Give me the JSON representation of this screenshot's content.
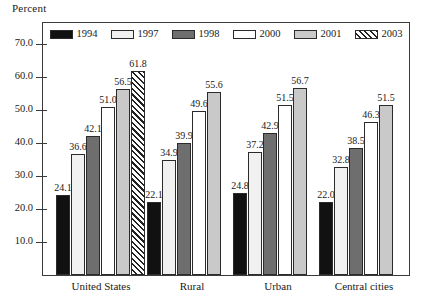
{
  "chart_data": {
    "type": "bar",
    "title": "",
    "xlabel": "",
    "ylabel": "Percent",
    "ylim": [
      0,
      75
    ],
    "yticks": [
      "10.0",
      "20.0",
      "30.0",
      "40.0",
      "50.0",
      "60.0",
      "70.0"
    ],
    "ytick_values": [
      10,
      20,
      30,
      40,
      50,
      60,
      70
    ],
    "grid": false,
    "legend_position": "top-inside",
    "categories": [
      "United States",
      "Rural",
      "Urban",
      "Central cities"
    ],
    "series": [
      {
        "name": "1994",
        "swatch": "fill-black",
        "color": "#111111",
        "values": [
          24.1,
          22.1,
          24.8,
          22.0
        ]
      },
      {
        "name": "1997",
        "swatch": "fill-offwht",
        "color": "#f1f1f1",
        "values": [
          36.6,
          34.9,
          37.2,
          32.8
        ]
      },
      {
        "name": "1998",
        "swatch": "fill-dgray",
        "color": "#6e6e6e",
        "values": [
          42.1,
          39.9,
          42.9,
          38.5
        ]
      },
      {
        "name": "2000",
        "swatch": "fill-white",
        "color": "#ffffff",
        "values": [
          51.0,
          49.6,
          51.5,
          46.3
        ]
      },
      {
        "name": "2001",
        "swatch": "fill-lgray",
        "color": "#c9c9c9",
        "values": [
          56.5,
          55.6,
          56.7,
          51.5
        ]
      },
      {
        "name": "2003",
        "swatch": "fill-hatch",
        "color": "#ffffff",
        "values": [
          61.8,
          null,
          null,
          null
        ]
      }
    ],
    "value_labels": {
      "United States": [
        "24.1",
        "36.6",
        "42.1",
        "51.0",
        "56.5",
        "61.8"
      ],
      "Rural": [
        "22.1",
        "34.9",
        "39.9",
        "49.6",
        "55.6"
      ],
      "Urban": [
        "24.8",
        "37.2",
        "42.9",
        "51.5",
        "56.7"
      ],
      "Central cities": [
        "22.0",
        "32.8",
        "38.5",
        "46.3",
        "51.5"
      ]
    }
  }
}
